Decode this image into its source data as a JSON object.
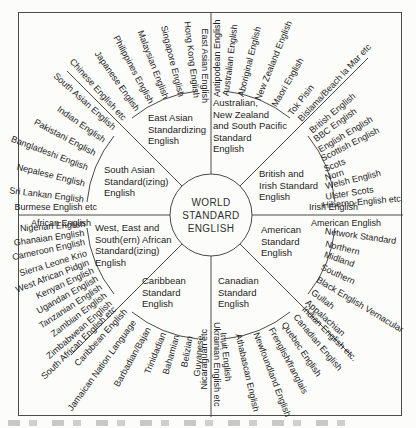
{
  "hub": {
    "lines": [
      "WORLD",
      "STANDARD",
      "ENGLISH"
    ]
  },
  "sectors": [
    {
      "id": "east-asian",
      "x": 148,
      "y": 112,
      "lines": [
        "East Asian",
        "Standardizing",
        "English"
      ]
    },
    {
      "id": "australian",
      "x": 213,
      "y": 97,
      "lines": [
        "Australian,",
        "New Zealand",
        "and South Pacific",
        "Standard",
        "English"
      ]
    },
    {
      "id": "british",
      "x": 259,
      "y": 168,
      "lines": [
        "British and",
        "Irish Standard",
        "English"
      ]
    },
    {
      "id": "american",
      "x": 261,
      "y": 224,
      "lines": [
        "American",
        "Standard",
        "English"
      ]
    },
    {
      "id": "canadian",
      "x": 218,
      "y": 275,
      "lines": [
        "Canadian",
        "Standard",
        "English"
      ]
    },
    {
      "id": "caribbean",
      "x": 142,
      "y": 275,
      "lines": [
        "Caribbean",
        "Standard",
        "English"
      ]
    },
    {
      "id": "african",
      "x": 95,
      "y": 222,
      "lines": [
        "West, East and",
        "South(ern) African",
        "Standard(izing)",
        "English"
      ]
    },
    {
      "id": "south-asian",
      "x": 104,
      "y": 164,
      "lines": [
        "South Asian",
        "Standard(izing)",
        "English"
      ]
    }
  ],
  "spokes": [
    {
      "t": "East Asian English",
      "b": 90,
      "r": 112,
      "a": "in",
      "dy": 6
    },
    {
      "t": "Hong Kong English",
      "b": 83,
      "r": 118,
      "a": "in"
    },
    {
      "t": "Singapore English",
      "b": 76,
      "r": 122,
      "a": "in"
    },
    {
      "t": "Malaysian English",
      "b": 69,
      "r": 125,
      "a": "in"
    },
    {
      "t": "Philippines English",
      "b": 62,
      "r": 127,
      "a": "in"
    },
    {
      "t": "Japanese English",
      "b": 55,
      "r": 128,
      "a": "in"
    },
    {
      "t": "Chinese English etc",
      "b": 48,
      "r": 129,
      "a": "in"
    },
    {
      "t": "South Asian English",
      "b": 42,
      "r": 130,
      "a": "in"
    },
    {
      "t": "Indian English",
      "b": 35,
      "r": 130,
      "a": "in"
    },
    {
      "t": "Pakistani English",
      "b": 28,
      "r": 131,
      "a": "in"
    },
    {
      "t": "Bangladeshi English",
      "b": 21,
      "r": 132,
      "a": "in"
    },
    {
      "t": "Nepalese English",
      "b": 14,
      "r": 130,
      "a": "in"
    },
    {
      "t": "Sri Lankan English",
      "b": 7,
      "r": 128,
      "a": "in"
    },
    {
      "t": "Burmese English etc",
      "b": 0,
      "r": 114,
      "a": "in",
      "dy": -8
    },
    {
      "t": "African English",
      "b": 0,
      "r": 120,
      "a": "in",
      "dy": 8
    },
    {
      "t": "Nigerian English",
      "b": -4,
      "r": 126,
      "a": "in"
    },
    {
      "t": "Ghanaian English",
      "b": -8,
      "r": 128,
      "a": "in"
    },
    {
      "t": "Cameroon English",
      "b": -12,
      "r": 129,
      "a": "in"
    },
    {
      "t": "Sierra Leone Krio",
      "b": -17,
      "r": 130,
      "a": "in"
    },
    {
      "t": "West African Pidgin",
      "b": -21,
      "r": 131,
      "a": "in"
    },
    {
      "t": "Kenyan English",
      "b": -25,
      "r": 130,
      "a": "in"
    },
    {
      "t": "Ugandan English",
      "b": -29,
      "r": 130,
      "a": "in"
    },
    {
      "t": "Tanzanian English",
      "b": -33,
      "r": 131,
      "a": "in"
    },
    {
      "t": "Zambian English",
      "b": -37,
      "r": 132,
      "a": "in"
    },
    {
      "t": "Zimbabwean English",
      "b": -41,
      "r": 133,
      "a": "in"
    },
    {
      "t": "South African English etc",
      "b": -44,
      "r": 134,
      "a": "in"
    },
    {
      "t": "Caribbean English",
      "b": -48,
      "r": 128,
      "a": "in"
    },
    {
      "t": "Jamaican Nation Language",
      "b": -54,
      "r": 131,
      "a": "in"
    },
    {
      "t": "Barbadian/Bajan",
      "b": -61,
      "r": 129,
      "a": "in"
    },
    {
      "t": "Trinidadian",
      "b": -68,
      "r": 127,
      "a": "in"
    },
    {
      "t": "Bahamian",
      "b": -74,
      "r": 125,
      "a": "in"
    },
    {
      "t": "Belizian",
      "b": -80,
      "r": 123,
      "a": "in"
    },
    {
      "t": "Guyanese",
      "b": -85,
      "r": 121,
      "a": "in"
    },
    {
      "t": "Nicaraguan etc",
      "b": -90,
      "r": 114,
      "a": "in",
      "dy": -7
    },
    {
      "t": "Canadian English",
      "b": 50,
      "r": 131,
      "a": "out"
    },
    {
      "t": "Quebec English",
      "b": 56,
      "r": 130,
      "a": "out"
    },
    {
      "t": "Frenglish/franglais",
      "b": 62,
      "r": 128,
      "a": "out"
    },
    {
      "t": "Newfoundland English",
      "b": 69,
      "r": 126,
      "a": "out"
    },
    {
      "t": "Athabascan English",
      "b": 77,
      "r": 122,
      "a": "out"
    },
    {
      "t": "Inuit English",
      "b": 84,
      "r": 118,
      "a": "out"
    },
    {
      "t": "Ukrainian English etc",
      "b": 90,
      "r": 107,
      "a": "out",
      "dy": -6
    },
    {
      "t": "American English",
      "b": 0,
      "r": 100,
      "a": "out",
      "dy": 8
    },
    {
      "t": "Network Standard",
      "b": 8,
      "r": 115,
      "a": "out"
    },
    {
      "t": "Northern",
      "b": 14,
      "r": 118,
      "a": "out"
    },
    {
      "t": "Midland",
      "b": 19,
      "r": 120,
      "a": "out"
    },
    {
      "t": "Southern",
      "b": 25,
      "r": 122,
      "a": "out"
    },
    {
      "t": "Black English Vernacular",
      "b": 31,
      "r": 124,
      "a": "out"
    },
    {
      "t": "Gullah",
      "b": 37,
      "r": 127,
      "a": "out"
    },
    {
      "t": "Appalachian",
      "b": 42,
      "r": 129,
      "a": "out"
    },
    {
      "t": "Indian English etc.",
      "b": 45,
      "r": 131,
      "a": "out"
    },
    {
      "t": "British English",
      "b": -40,
      "r": 130,
      "a": "out"
    },
    {
      "t": "BBC English",
      "b": -36,
      "r": 128,
      "a": "out"
    },
    {
      "t": "English English",
      "b": -31,
      "r": 126,
      "a": "out"
    },
    {
      "t": "Scottish English",
      "b": -27,
      "r": 124,
      "a": "out"
    },
    {
      "t": "Scots",
      "b": -22,
      "r": 122,
      "a": "out"
    },
    {
      "t": "Norn",
      "b": -18,
      "r": 120,
      "a": "out"
    },
    {
      "t": "Welsh English",
      "b": -14,
      "r": 118,
      "a": "out"
    },
    {
      "t": "Ulster Scots",
      "b": -9,
      "r": 116,
      "a": "out"
    },
    {
      "t": "Hiberno-English etc",
      "b": -5,
      "r": 112,
      "a": "out"
    },
    {
      "t": "Irish English",
      "b": 0,
      "r": 98,
      "a": "out",
      "dy": -8
    },
    {
      "t": "Antipodean English",
      "b": -90,
      "r": 118,
      "a": "out",
      "dy": 6
    },
    {
      "t": "Australian English",
      "b": -83,
      "r": 120,
      "a": "out"
    },
    {
      "t": "Aboriginal English",
      "b": -76,
      "r": 122,
      "a": "out"
    },
    {
      "t": "New Zealand English",
      "b": -68,
      "r": 124,
      "a": "out"
    },
    {
      "t": "Maori English",
      "b": -60,
      "r": 126,
      "a": "out"
    },
    {
      "t": "Tok Pisin",
      "b": -52,
      "r": 128,
      "a": "out"
    },
    {
      "t": "Bislama/Beach la Mar etc",
      "b": -47,
      "r": 130,
      "a": "out"
    }
  ],
  "style": {
    "ink": "#1f1f1f",
    "line": "#4a4a4a",
    "background": "#fcfcfa"
  }
}
